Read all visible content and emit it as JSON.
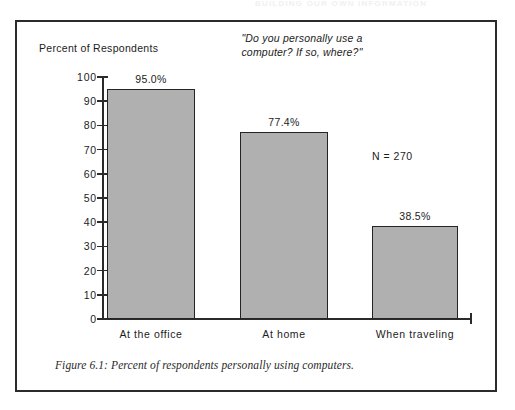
{
  "page_header": "BUILDING OUR OWN INFORMATION",
  "figure": {
    "caption": "Figure 6.1: Percent of respondents personally using computers.",
    "n_annotation": "N = 270"
  },
  "chart_data": {
    "type": "bar",
    "title": "\"Do you personally use a\ncomputer? If so, where?\"",
    "title_line1": "\"Do you personally use a",
    "title_line2": "computer? If so, where?\"",
    "xlabel": "",
    "ylabel": "Percent of Respondents",
    "categories": [
      "At the office",
      "At home",
      "When traveling"
    ],
    "values": [
      95.0,
      77.4,
      38.5
    ],
    "value_labels": [
      "95.0%",
      "77.4%",
      "38.5%"
    ],
    "ylim": [
      0,
      100
    ],
    "ytick_values": [
      0,
      10,
      20,
      30,
      40,
      50,
      60,
      70,
      80,
      90,
      100
    ],
    "ytick_labels": [
      "0",
      "10",
      "20",
      "30",
      "40",
      "50",
      "60",
      "70",
      "80",
      "90",
      "100"
    ],
    "grid": false,
    "legend": "none",
    "bar_fill_color": "#b0b0b0",
    "bar_border_color": "#242424",
    "axis_color": "#2b2b2b",
    "sample_size": 270,
    "annotations": [
      "N = 270"
    ]
  }
}
